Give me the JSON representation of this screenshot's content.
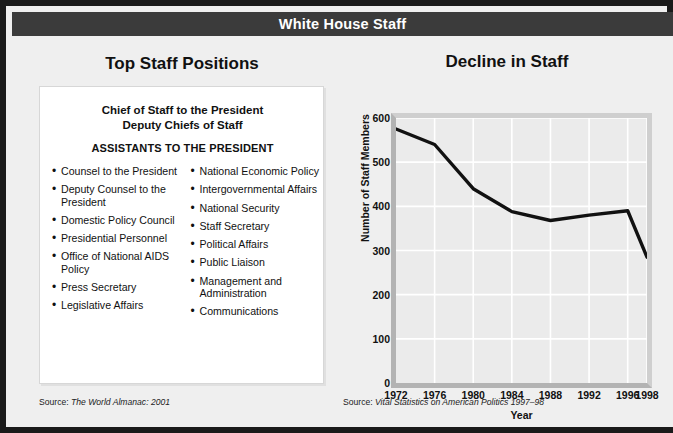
{
  "header": {
    "title": "White House Staff"
  },
  "left_panel": {
    "heading": "Top Staff Positions",
    "top_lines": [
      "Chief of Staff to the President",
      "Deputy Chiefs of Staff"
    ],
    "assistants_heading": "ASSISTANTS TO THE PRESIDENT",
    "bullet_char": "•",
    "column_left": [
      "Counsel to the President",
      "Deputy Counsel to the President",
      "Domestic Policy Council",
      "Presidential Personnel",
      "Office of National AIDS Policy",
      "Press Secretary",
      "Legislative Affairs"
    ],
    "column_right": [
      "National Economic Policy",
      "Intergovernmental Affairs",
      "National Security",
      "Staff Secretary",
      "Political Affairs",
      "Public Liaison",
      "Management and Administration",
      "Communications"
    ],
    "source_prefix": "Source: ",
    "source_title": "The World Almanac: 2001"
  },
  "right_panel": {
    "source_prefix": "Source: ",
    "source_title": "Vital Statistics on American Politics 1997–98"
  },
  "chart_data": {
    "type": "line",
    "title": "Decline in Staff",
    "xlabel": "Year",
    "ylabel": "Number of Staff Members",
    "x": [
      1972,
      1976,
      1980,
      1984,
      1988,
      1992,
      1996,
      1998
    ],
    "values": [
      575,
      540,
      440,
      388,
      368,
      380,
      390,
      285
    ],
    "xtick_labels": [
      "1972",
      "1976",
      "1980",
      "1984",
      "1988",
      "1992",
      "1996",
      "1998"
    ],
    "ytick_labels": [
      "0",
      "100",
      "200",
      "300",
      "400",
      "500",
      "600"
    ],
    "yticks": [
      0,
      100,
      200,
      300,
      400,
      500,
      600
    ],
    "ylim": [
      0,
      600
    ],
    "xlim": [
      1972,
      1998
    ],
    "grid": true,
    "legend": "none",
    "line_color": "#111111",
    "plot_background": "#ebebeb",
    "gridline_color": "#ffffff"
  },
  "theme": {
    "border_color": "#1a1a1a",
    "titlebar_color": "#3b3b3b",
    "panel_background": "#efefef",
    "box_background": "#ffffff"
  }
}
